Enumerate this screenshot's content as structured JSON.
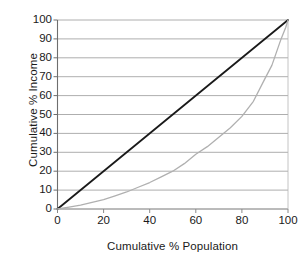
{
  "chart_data": {
    "type": "line",
    "title": "",
    "xlabel": "Cumulative % Population",
    "ylabel": "Cumulative % Income",
    "xlim": [
      0,
      100
    ],
    "ylim": [
      0,
      100
    ],
    "xticks": [
      "0",
      "20",
      "40",
      "60",
      "80",
      "100"
    ],
    "xtick_values": [
      0,
      20,
      40,
      60,
      80,
      100
    ],
    "yticks": [
      "0",
      "10",
      "20",
      "30",
      "40",
      "50",
      "60",
      "70",
      "80",
      "90",
      "100"
    ],
    "ytick_values": [
      0,
      10,
      20,
      30,
      40,
      50,
      60,
      70,
      80,
      90,
      100
    ],
    "grid": "horizontal",
    "legend": "none",
    "series": [
      {
        "name": "Line of equality",
        "color": "#1a1a1a",
        "x": [
          0,
          100
        ],
        "values": [
          0,
          100
        ]
      },
      {
        "name": "Lorenz curve",
        "color": "#b0b0b0",
        "x": [
          0,
          5,
          10,
          15,
          20,
          25,
          30,
          35,
          40,
          45,
          50,
          55,
          60,
          65,
          70,
          75,
          80,
          85,
          90,
          93,
          95,
          97,
          98,
          99,
          100
        ],
        "values": [
          0,
          1,
          2,
          3.5,
          5,
          7,
          9,
          11.5,
          14,
          17,
          20,
          24,
          29,
          33,
          38,
          43,
          49,
          57,
          69,
          76,
          83,
          90,
          93,
          96,
          100
        ]
      }
    ]
  }
}
